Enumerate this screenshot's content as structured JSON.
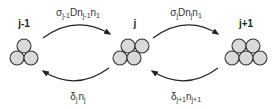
{
  "diagram": {
    "type": "cluster-transition",
    "colors": {
      "particle_fill": "#d9d9d9",
      "stroke": "#222222"
    },
    "clusters": [
      {
        "label": "j-1",
        "particle_count": 3
      },
      {
        "label": "j",
        "particle_count": 4
      },
      {
        "label": "j+1",
        "particle_count": 5
      }
    ],
    "transitions": [
      {
        "from": "j-1",
        "to": "j",
        "direction": "forward",
        "rate_parts": {
          "sigma": "σ",
          "sigma_sub": "j-1",
          "mid": "Dn",
          "mid_sub": "j-1",
          "n": "n",
          "n_sub": "1"
        }
      },
      {
        "from": "j",
        "to": "j+1",
        "direction": "forward",
        "rate_parts": {
          "sigma": "σ",
          "sigma_sub": "j",
          "mid": "Dn",
          "mid_sub": "j",
          "n": "n",
          "n_sub": "1"
        }
      },
      {
        "from": "j",
        "to": "j-1",
        "direction": "backward",
        "rate_parts": {
          "delta": "δ",
          "delta_sub": "j",
          "n": "n",
          "n_sub": "j"
        }
      },
      {
        "from": "j+1",
        "to": "j",
        "direction": "backward",
        "rate_parts": {
          "delta": "δ",
          "delta_sub": "j+1",
          "n": "n",
          "n_sub": "j+1"
        }
      }
    ]
  }
}
